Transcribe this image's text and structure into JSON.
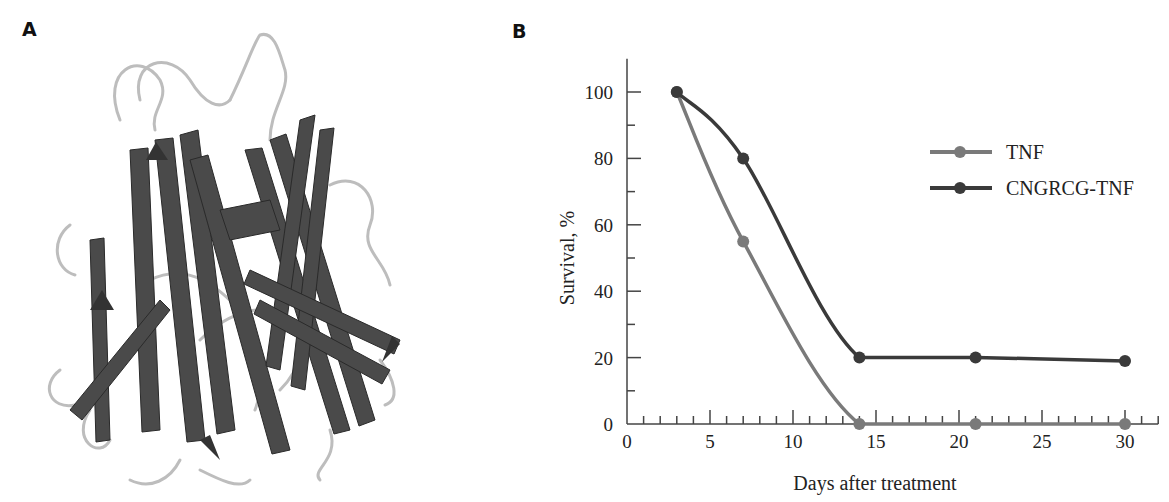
{
  "panels": {
    "a": {
      "label": "A",
      "image": "protein-ribbon-structure"
    },
    "b": {
      "label": "B"
    }
  },
  "chart_data": {
    "type": "line",
    "title": "",
    "xlabel": "Days after treatment",
    "ylabel": "Survival, %",
    "xlim": [
      0,
      32
    ],
    "ylim": [
      0,
      110
    ],
    "xticks": [
      0,
      5,
      10,
      15,
      20,
      25,
      30
    ],
    "yticks": [
      0,
      20,
      40,
      60,
      80,
      100
    ],
    "grid": false,
    "legend_position": "upper right",
    "series": [
      {
        "name": "TNF",
        "color": "#7a7a7a",
        "x": [
          3,
          7,
          14,
          21,
          30
        ],
        "values": [
          100,
          55,
          0,
          0,
          0
        ]
      },
      {
        "name": "CNGRCG-TNF",
        "color": "#3a3a3a",
        "x": [
          3,
          7,
          14,
          21,
          30
        ],
        "values": [
          100,
          80,
          20,
          20,
          19
        ]
      }
    ]
  }
}
